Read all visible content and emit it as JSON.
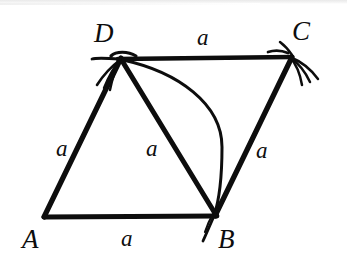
{
  "figure": {
    "shape_type": "rhombus",
    "stroke_color": "#0d0d0d",
    "background_color": "#ffffff",
    "vertices": [
      {
        "name": "A",
        "label": "A",
        "x": 44,
        "y": 217,
        "label_x": 22,
        "label_y": 226
      },
      {
        "name": "B",
        "label": "B",
        "x": 215,
        "y": 216,
        "label_x": 218,
        "label_y": 226
      },
      {
        "name": "C",
        "label": "C",
        "x": 292,
        "y": 57,
        "label_x": 292,
        "label_y": 18
      },
      {
        "name": "D",
        "label": "D",
        "x": 121,
        "y": 58,
        "label_x": 94,
        "label_y": 20
      }
    ],
    "edges": [
      {
        "name": "side-AD",
        "from": "A",
        "to": "D",
        "length_label": "a",
        "label_x": 56,
        "label_y": 137
      },
      {
        "name": "side-DC",
        "from": "D",
        "to": "C",
        "length_label": "a",
        "label_x": 197,
        "label_y": 26
      },
      {
        "name": "side-BC",
        "from": "B",
        "to": "C",
        "length_label": "a",
        "label_x": 256,
        "label_y": 139
      },
      {
        "name": "side-AB",
        "from": "A",
        "to": "B",
        "length_label": "a",
        "label_x": 121,
        "label_y": 227
      }
    ],
    "diagonals": [
      {
        "name": "diagonal-DB",
        "from": "D",
        "to": "B",
        "length_label": "a",
        "label_x": 146,
        "label_y": 137
      }
    ],
    "arcs": [
      {
        "name": "construction-arc-DB",
        "from": "D",
        "to": "B",
        "bulge_direction": "right",
        "apex_x": 222,
        "apex_y": 145
      }
    ],
    "tick_marks": [
      {
        "name": "compass-marks-at-D",
        "at_vertex": "D",
        "count": 4,
        "direction": "down-left"
      },
      {
        "name": "compass-marks-at-C",
        "at_vertex": "C",
        "count": 4,
        "direction": "down-right"
      },
      {
        "name": "compass-marks-at-B",
        "at_vertex": "B",
        "count": 2,
        "direction": "down-left"
      }
    ],
    "all_side_labels_equal": "a"
  }
}
